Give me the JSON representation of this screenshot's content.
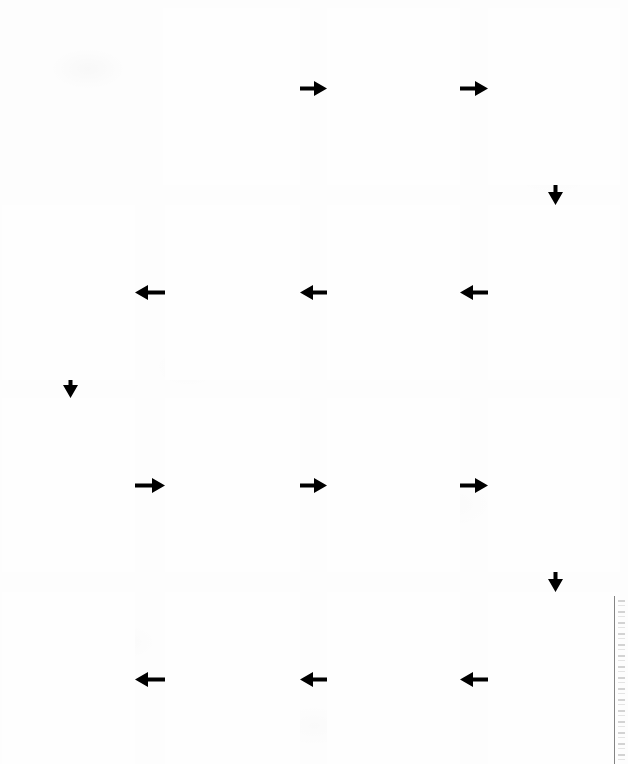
{
  "document": {
    "type": "blank-flowchart-worksheet",
    "title": "",
    "page_width": 628,
    "page_height": 764,
    "background_color": "#fdfdfd",
    "box_border_color": "#3a3a3a",
    "arrow_color": "#000000"
  },
  "chart_data": {
    "type": "diagram",
    "diagram_type": "flowchart",
    "flow_pattern": "serpentine",
    "title": "",
    "node_count": 15,
    "all_nodes_empty": true,
    "columns": 4,
    "rows": 4,
    "nodes": [
      {
        "id": "r1c2",
        "row": 1,
        "col": 2,
        "label": "",
        "x": 163,
        "y": 8,
        "w": 137,
        "h": 177,
        "clipped": false
      },
      {
        "id": "r1c3",
        "row": 1,
        "col": 3,
        "label": "",
        "x": 327,
        "y": 8,
        "w": 133,
        "h": 177,
        "clipped": false
      },
      {
        "id": "r1c4",
        "row": 1,
        "col": 4,
        "label": "",
        "x": 488,
        "y": 8,
        "w": 132,
        "h": 177,
        "clipped": false
      },
      {
        "id": "r2c1",
        "row": 2,
        "col": 1,
        "label": "",
        "x": 2,
        "y": 205,
        "w": 133,
        "h": 175,
        "clipped": false
      },
      {
        "id": "r2c2",
        "row": 2,
        "col": 2,
        "label": "",
        "x": 165,
        "y": 205,
        "w": 135,
        "h": 175,
        "clipped": false
      },
      {
        "id": "r2c3",
        "row": 2,
        "col": 3,
        "label": "",
        "x": 327,
        "y": 205,
        "w": 133,
        "h": 175,
        "clipped": false
      },
      {
        "id": "r2c4",
        "row": 2,
        "col": 4,
        "label": "",
        "x": 488,
        "y": 205,
        "w": 132,
        "h": 175,
        "clipped": false
      },
      {
        "id": "r3c1",
        "row": 3,
        "col": 1,
        "label": "",
        "x": 2,
        "y": 398,
        "w": 133,
        "h": 174,
        "clipped": false
      },
      {
        "id": "r3c2",
        "row": 3,
        "col": 2,
        "label": "",
        "x": 165,
        "y": 398,
        "w": 135,
        "h": 174,
        "clipped": false
      },
      {
        "id": "r3c3",
        "row": 3,
        "col": 3,
        "label": "",
        "x": 327,
        "y": 398,
        "w": 133,
        "h": 174,
        "clipped": false
      },
      {
        "id": "r3c4",
        "row": 3,
        "col": 4,
        "label": "",
        "x": 488,
        "y": 398,
        "w": 132,
        "h": 174,
        "clipped": false
      },
      {
        "id": "r4c1",
        "row": 4,
        "col": 1,
        "label": "",
        "x": 2,
        "y": 592,
        "w": 133,
        "h": 172,
        "clipped": true
      },
      {
        "id": "r4c2",
        "row": 4,
        "col": 2,
        "label": "",
        "x": 165,
        "y": 592,
        "w": 135,
        "h": 172,
        "clipped": true
      },
      {
        "id": "r4c3",
        "row": 4,
        "col": 3,
        "label": "",
        "x": 327,
        "y": 592,
        "w": 133,
        "h": 172,
        "clipped": true
      },
      {
        "id": "r4c4",
        "row": 4,
        "col": 4,
        "label": "",
        "x": 488,
        "y": 592,
        "w": 132,
        "h": 172,
        "clipped": true
      }
    ],
    "edges": [
      {
        "id": "e1",
        "from": "r1c2",
        "to": "r1c3",
        "direction": "right",
        "x": 300,
        "y": 88,
        "length": 27
      },
      {
        "id": "e2",
        "from": "r1c3",
        "to": "r1c4",
        "direction": "right",
        "x": 460,
        "y": 88,
        "length": 28
      },
      {
        "id": "e3",
        "from": "r1c4",
        "to": "r2c4",
        "direction": "down",
        "x": 548,
        "y": 185,
        "length": 20
      },
      {
        "id": "e4",
        "from": "r2c4",
        "to": "r2c3",
        "direction": "left",
        "x": 460,
        "y": 292,
        "length": 28
      },
      {
        "id": "e5",
        "from": "r2c3",
        "to": "r2c2",
        "direction": "left",
        "x": 300,
        "y": 292,
        "length": 27
      },
      {
        "id": "e6",
        "from": "r2c2",
        "to": "r2c1",
        "direction": "left",
        "x": 135,
        "y": 292,
        "length": 30
      },
      {
        "id": "e7",
        "from": "r2c1",
        "to": "r3c1",
        "direction": "down",
        "x": 63,
        "y": 380,
        "length": 18
      },
      {
        "id": "e8",
        "from": "r3c1",
        "to": "r3c2",
        "direction": "right",
        "x": 135,
        "y": 485,
        "length": 30
      },
      {
        "id": "e9",
        "from": "r3c2",
        "to": "r3c3",
        "direction": "right",
        "x": 300,
        "y": 485,
        "length": 27
      },
      {
        "id": "e10",
        "from": "r3c3",
        "to": "r3c4",
        "direction": "right",
        "x": 460,
        "y": 485,
        "length": 28
      },
      {
        "id": "e11",
        "from": "r3c4",
        "to": "r4c4",
        "direction": "down",
        "x": 548,
        "y": 572,
        "length": 20
      },
      {
        "id": "e12",
        "from": "r4c4",
        "to": "r4c3",
        "direction": "left",
        "x": 460,
        "y": 679,
        "length": 28
      },
      {
        "id": "e13",
        "from": "r4c3",
        "to": "r4c2",
        "direction": "left",
        "x": 300,
        "y": 679,
        "length": 27
      },
      {
        "id": "e14",
        "from": "r4c2",
        "to": "r4c1",
        "direction": "left",
        "x": 135,
        "y": 679,
        "length": 30
      }
    ]
  }
}
